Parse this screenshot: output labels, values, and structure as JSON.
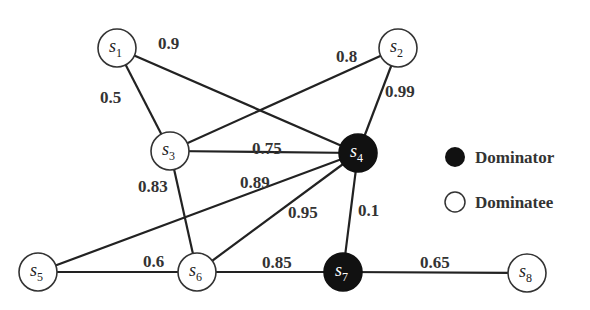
{
  "diagram": {
    "nodes": [
      {
        "id": "s1",
        "base": "s",
        "sub": "1",
        "x": 117,
        "y": 48,
        "role": "dominatee"
      },
      {
        "id": "s2",
        "base": "s",
        "sub": "2",
        "x": 398,
        "y": 48,
        "role": "dominatee"
      },
      {
        "id": "s3",
        "base": "s",
        "sub": "3",
        "x": 170,
        "y": 151,
        "role": "dominatee"
      },
      {
        "id": "s4",
        "base": "s",
        "sub": "4",
        "x": 358,
        "y": 153,
        "role": "dominator"
      },
      {
        "id": "s5",
        "base": "s",
        "sub": "5",
        "x": 38,
        "y": 272,
        "role": "dominatee"
      },
      {
        "id": "s6",
        "base": "s",
        "sub": "6",
        "x": 197,
        "y": 272,
        "role": "dominatee"
      },
      {
        "id": "s7",
        "base": "s",
        "sub": "7",
        "x": 343,
        "y": 272,
        "role": "dominator"
      },
      {
        "id": "s8",
        "base": "s",
        "sub": "8",
        "x": 527,
        "y": 273,
        "role": "dominatee"
      }
    ],
    "edges": [
      {
        "from": "s1",
        "to": "s3",
        "weight": "0.5",
        "lx": 100,
        "ly": 103
      },
      {
        "from": "s1",
        "to": "s4",
        "weight": "0.9",
        "lx": 158,
        "ly": 49
      },
      {
        "from": "s2",
        "to": "s3",
        "weight": "0.8",
        "lx": 336,
        "ly": 62
      },
      {
        "from": "s2",
        "to": "s4",
        "weight": "0.99",
        "lx": 385,
        "ly": 97
      },
      {
        "from": "s3",
        "to": "s4",
        "weight": "0.75",
        "lx": 252,
        "ly": 154
      },
      {
        "from": "s3",
        "to": "s6",
        "weight": "0.83",
        "lx": 138,
        "ly": 192
      },
      {
        "from": "s4",
        "to": "s5",
        "weight": "0.89",
        "lx": 240,
        "ly": 188
      },
      {
        "from": "s4",
        "to": "s6",
        "weight": "0.95",
        "lx": 288,
        "ly": 218
      },
      {
        "from": "s4",
        "to": "s7",
        "weight": "0.1",
        "lx": 358,
        "ly": 216
      },
      {
        "from": "s5",
        "to": "s6",
        "weight": "0.6",
        "lx": 143,
        "ly": 267
      },
      {
        "from": "s6",
        "to": "s7",
        "weight": "0.85",
        "lx": 262,
        "ly": 268
      },
      {
        "from": "s7",
        "to": "s8",
        "weight": "0.65",
        "lx": 420,
        "ly": 268
      }
    ],
    "node_radius": 19
  },
  "legend": {
    "items": [
      {
        "label": "Dominator",
        "symbol": "filled-circle",
        "color": "#111111"
      },
      {
        "label": "Dominatee",
        "symbol": "hollow-circle",
        "color": "#ffffff"
      }
    ]
  }
}
